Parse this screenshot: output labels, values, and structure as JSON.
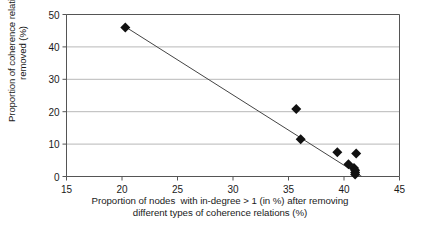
{
  "chart_data": {
    "type": "scatter",
    "title": "",
    "subtitle": "",
    "xlabel_line1": "Proportion of nodes  with in-degree > 1 (in %) after removing",
    "xlabel_line2": "different types of coherence relations (%)",
    "ylabel_line1": "Proportion of coherence relations",
    "ylabel_line2": "removed (%)",
    "xlim": [
      15,
      45
    ],
    "ylim": [
      0,
      50
    ],
    "xticks": [
      15,
      20,
      25,
      30,
      35,
      40,
      45
    ],
    "yticks": [
      0,
      10,
      20,
      30,
      40,
      50
    ],
    "xtick_labels": [
      "15",
      "20",
      "25",
      "30",
      "35",
      "40",
      "45"
    ],
    "ytick_labels": [
      "0",
      "10",
      "20",
      "30",
      "40",
      "50"
    ],
    "grid": "horizontal",
    "legend": "none",
    "marker": "diamond",
    "marker_color": "#111111",
    "marker_size": 5,
    "axis_color": "#555555",
    "grid_color": "#b8b8b8",
    "plot_border": "#555555",
    "points": [
      {
        "x": 20.3,
        "y": 46.0
      },
      {
        "x": 35.7,
        "y": 20.8
      },
      {
        "x": 36.1,
        "y": 11.5
      },
      {
        "x": 39.4,
        "y": 7.5
      },
      {
        "x": 41.1,
        "y": 7.1
      },
      {
        "x": 40.4,
        "y": 3.8
      },
      {
        "x": 40.9,
        "y": 2.6
      },
      {
        "x": 41.0,
        "y": 1.9
      },
      {
        "x": 41.0,
        "y": 1.2
      },
      {
        "x": 41.0,
        "y": 0.6
      }
    ],
    "trendline": {
      "type": "linear",
      "color": "#444444",
      "width": 1,
      "x0": 20.3,
      "y0": 46.2,
      "x1": 41.6,
      "y1": 0.0
    }
  }
}
